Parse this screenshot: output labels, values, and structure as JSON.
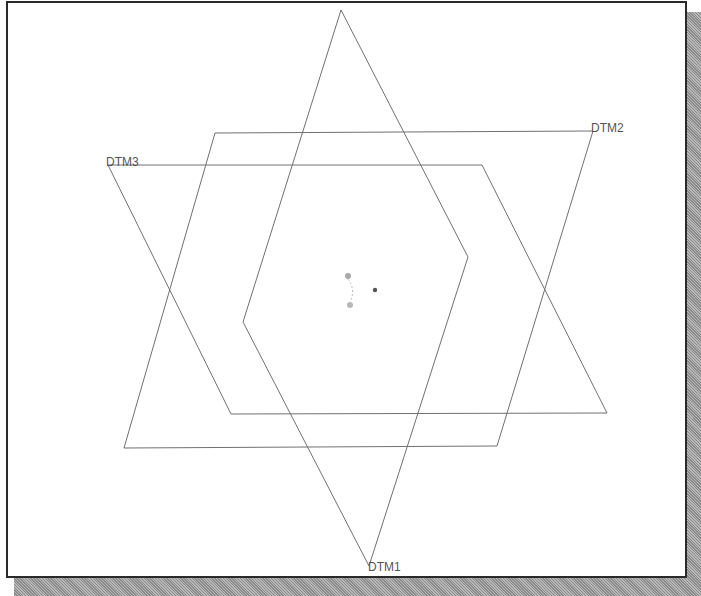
{
  "viewport": {
    "background": "#ffffff",
    "border_color": "#2a2a2a"
  },
  "datum_planes": [
    {
      "name": "DTM1",
      "label": "DTM1",
      "points": "341,10 468,257 369,566 243,322",
      "label_x": 368,
      "label_y": 571
    },
    {
      "name": "DTM2",
      "label": "DTM2",
      "points": "215,133 593,131 497,446 124,448",
      "label_x": 591,
      "label_y": 132
    },
    {
      "name": "DTM3",
      "label": "DTM3",
      "points": "108,165 482,165 607,413 231,414",
      "label_x": 106,
      "label_y": 166
    }
  ],
  "labels": {
    "dtm1": "DTM1",
    "dtm2": "DTM2",
    "dtm3": "DTM3"
  },
  "origin_marker": {
    "csys_dots": [
      [
        348,
        276
      ],
      [
        350,
        305
      ]
    ],
    "center_point": [
      375,
      290
    ]
  },
  "colors": {
    "plane_stroke": "#707070",
    "label": "#555555",
    "shadow": "#9a9a9a"
  }
}
